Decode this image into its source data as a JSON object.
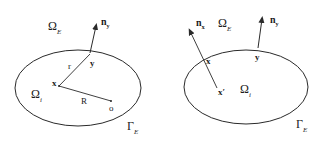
{
  "figure": {
    "left_panel": {
      "exterior_domain": {
        "symbol": "Ω",
        "subscript": "E"
      },
      "interior_domain": {
        "symbol": "Ω",
        "subscript": "i"
      },
      "boundary": {
        "symbol": "Γ",
        "subscript": "E"
      },
      "normal": {
        "symbol": "n",
        "subscript": "y"
      },
      "point_x": "x",
      "point_y": "y",
      "origin": "o",
      "segment_r": "r",
      "segment_R": "R"
    },
    "right_panel": {
      "exterior_domain": {
        "symbol": "Ω",
        "subscript": "E"
      },
      "interior_domain": {
        "symbol": "Ω",
        "subscript": "i"
      },
      "boundary": {
        "symbol": "Γ",
        "subscript": "E"
      },
      "normal_x": {
        "symbol": "n",
        "subscript": "x"
      },
      "normal_y": {
        "symbol": "n",
        "subscript": "y"
      },
      "point_x": "x",
      "point_x_prime": "x′",
      "point_y": "y"
    },
    "colors": {
      "stroke": "#2a2a2a",
      "background": "#ffffff"
    }
  }
}
